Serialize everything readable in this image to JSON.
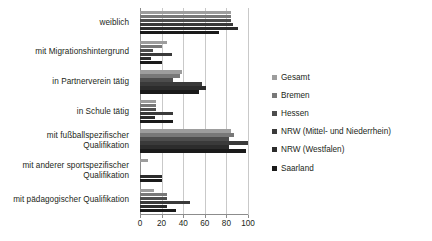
{
  "chart_data": {
    "type": "bar",
    "orientation": "horizontal",
    "title": "",
    "subtitle": "",
    "xlabel": "",
    "ylabel": "",
    "xlim": [
      0,
      100
    ],
    "xticks": [
      0,
      20,
      40,
      60,
      80,
      100
    ],
    "xtick_labels": [
      "0",
      "20",
      "40",
      "60",
      "80",
      "100"
    ],
    "grid": true,
    "legend_position": "right",
    "categories": [
      "weiblich",
      "mit Migrationshintergrund",
      "in Partnerverein tätig",
      "in Schule tätig",
      "mit fußballspezifischer Qualifikation",
      "mit anderer sportspezifischer Qualifikation",
      "mit pädagogischer Qualifikation"
    ],
    "series": [
      {
        "name": "Gesamt",
        "color": "#9d9d9d",
        "values": [
          84,
          25,
          39,
          15,
          84,
          7,
          13
        ]
      },
      {
        "name": "Bremen",
        "color": "#787878",
        "values": [
          84,
          20,
          37,
          15,
          87,
          0,
          25
        ]
      },
      {
        "name": "Hessen",
        "color": "#4d4d4d",
        "values": [
          84,
          12,
          31,
          15,
          82,
          0,
          25
        ]
      },
      {
        "name": "NRW (Mittel- und Niederrhein)",
        "color": "#3a3a3a",
        "values": [
          86,
          30,
          57,
          31,
          100,
          0,
          46
        ]
      },
      {
        "name": "NRW (Westfalen)",
        "color": "#2c2c2c",
        "values": [
          91,
          10,
          61,
          14,
          82,
          20,
          25
        ]
      },
      {
        "name": "Saarland",
        "color": "#1a1a1a",
        "values": [
          73,
          20,
          55,
          31,
          98,
          20,
          33
        ]
      }
    ]
  },
  "legend": {
    "items": [
      {
        "label": "Gesamt"
      },
      {
        "label": "Bremen"
      },
      {
        "label": "Hessen"
      },
      {
        "label": "NRW (Mittel- und Niederrhein)"
      },
      {
        "label": "NRW (Westfalen)"
      },
      {
        "label": "Saarland"
      }
    ]
  },
  "colors": {
    "grid": "#c9c9c9",
    "axis": "#8c8c8c",
    "text": "#231f20",
    "background": "#ffffff"
  }
}
